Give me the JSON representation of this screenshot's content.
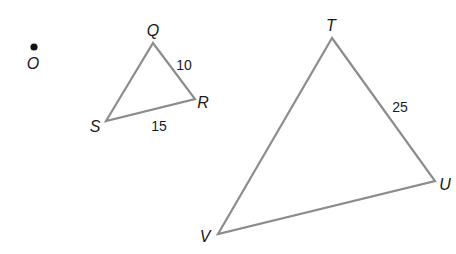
{
  "figure": {
    "center_point": {
      "label": "O",
      "x": 34,
      "y": 47
    },
    "triangles": [
      {
        "name": "QRS",
        "vertices": [
          {
            "label": "Q",
            "x": 153,
            "y": 43,
            "lx": 153,
            "ly": 36
          },
          {
            "label": "R",
            "x": 195,
            "y": 99,
            "lx": 203,
            "ly": 108
          },
          {
            "label": "S",
            "x": 106,
            "y": 121,
            "lx": 95,
            "ly": 132
          }
        ],
        "side_labels": [
          {
            "text": "10",
            "side": "QR",
            "x": 184,
            "y": 70
          },
          {
            "text": "15",
            "side": "SR",
            "x": 159,
            "y": 131
          }
        ]
      },
      {
        "name": "TUV",
        "vertices": [
          {
            "label": "T",
            "x": 332,
            "y": 38,
            "lx": 331,
            "ly": 31
          },
          {
            "label": "U",
            "x": 435,
            "y": 181,
            "lx": 445,
            "ly": 190
          },
          {
            "label": "V",
            "x": 218,
            "y": 234,
            "lx": 205,
            "ly": 242
          }
        ],
        "side_labels": [
          {
            "text": "25",
            "side": "TU",
            "x": 400,
            "y": 112
          }
        ]
      }
    ]
  }
}
